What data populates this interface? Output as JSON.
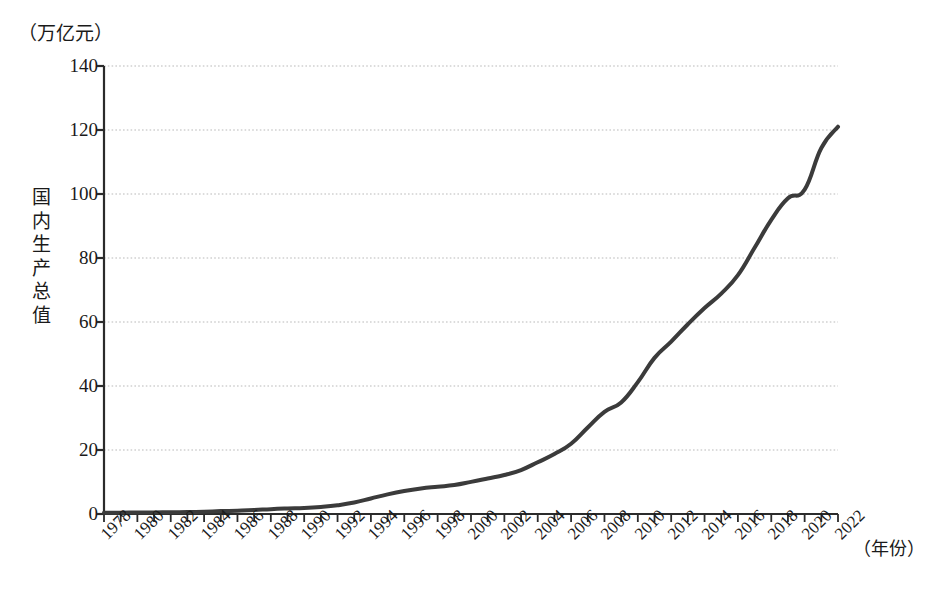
{
  "chart_data": {
    "type": "line",
    "title": "",
    "subtitle": "",
    "xlabel": "（年份）",
    "ylabel": "国内生产总值",
    "yunit": "（万亿元）",
    "ylim": [
      0,
      140
    ],
    "yticks": [
      0,
      20,
      40,
      60,
      80,
      100,
      120,
      140
    ],
    "ytick_labels": [
      "0",
      "20",
      "40",
      "60",
      "80",
      "100",
      "120",
      "140"
    ],
    "xlim": [
      1978,
      2022
    ],
    "xtick_labels": [
      "1978",
      "1980",
      "1982",
      "1984",
      "1986",
      "1988",
      "1990",
      "1992",
      "1994",
      "1996",
      "1998",
      "2000",
      "2002",
      "2004",
      "2006",
      "2008",
      "2010",
      "2012",
      "2014",
      "2016",
      "2018",
      "2020",
      "2022"
    ],
    "grid": true,
    "grid_style": "dotted",
    "legend": "none",
    "line_color": "#3b3b3b",
    "line_width": 4,
    "x": [
      1978,
      1979,
      1980,
      1981,
      1982,
      1983,
      1984,
      1985,
      1986,
      1987,
      1988,
      1989,
      1990,
      1991,
      1992,
      1993,
      1994,
      1995,
      1996,
      1997,
      1998,
      1999,
      2000,
      2001,
      2002,
      2003,
      2004,
      2005,
      2006,
      2007,
      2008,
      2009,
      2010,
      2011,
      2012,
      2013,
      2014,
      2015,
      2016,
      2017,
      2018,
      2019,
      2020,
      2021,
      2022
    ],
    "values": [
      0.37,
      0.41,
      0.46,
      0.49,
      0.54,
      0.6,
      0.72,
      0.91,
      1.04,
      1.22,
      1.52,
      1.72,
      1.87,
      2.19,
      2.72,
      3.57,
      4.86,
      6.13,
      7.18,
      7.97,
      8.52,
      9.06,
      10.03,
      11.09,
      12.17,
      13.74,
      16.18,
      18.73,
      21.94,
      27.01,
      31.92,
      34.85,
      41.21,
      48.79,
      53.86,
      59.3,
      64.36,
      68.89,
      74.64,
      83.2,
      91.93,
      98.65,
      101.36,
      114.37,
      121.02
    ],
    "series_name": "国内生产总值",
    "annotations": []
  },
  "axes": {
    "unit_label_top": "（万亿元）",
    "y_title_chars": "国内生产总值",
    "x_unit_right": "（年份）"
  }
}
